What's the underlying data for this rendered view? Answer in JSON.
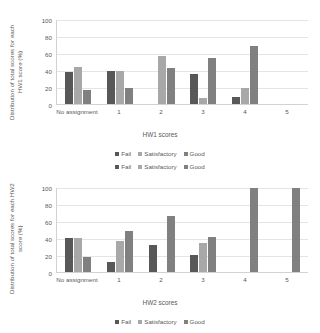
{
  "colors": {
    "fail": "#585858",
    "satisfactory": "#a8a8a8",
    "good": "#808080",
    "gridline": "#e4e4e4",
    "axis": "#d2d2d2",
    "text": "#595959"
  },
  "chart_data": [
    {
      "type": "bar",
      "title": "",
      "xlabel": "HW1 scores",
      "ylabel": "Distribution of total scores for each HW1 score (%)",
      "categories": [
        "No assignment",
        "1",
        "2",
        "3",
        "4",
        "5"
      ],
      "ylim": [
        0,
        100
      ],
      "yticks": [
        0,
        20,
        40,
        60,
        80,
        100
      ],
      "grid": true,
      "legend_position": "bottom",
      "series": [
        {
          "name": "Fail",
          "values": [
            38,
            39,
            0,
            35,
            8,
            0
          ]
        },
        {
          "name": "Satisfactory",
          "values": [
            44,
            39,
            57,
            7,
            19,
            0
          ]
        },
        {
          "name": "Good",
          "values": [
            16,
            19,
            42,
            54,
            68,
            0
          ]
        }
      ]
    },
    {
      "type": "bar",
      "title": "",
      "xlabel": "HW2 scores",
      "ylabel": "Distribution of total scores for each HW2 score (%)",
      "categories": [
        "No assignment",
        "1",
        "2",
        "3",
        "4",
        "5"
      ],
      "ylim": [
        0,
        100
      ],
      "yticks": [
        0,
        20,
        40,
        60,
        80,
        100
      ],
      "grid": true,
      "legend_position": "both",
      "series": [
        {
          "name": "Fail",
          "values": [
            40,
            12,
            32,
            20,
            0,
            0
          ]
        },
        {
          "name": "Satisfactory",
          "values": [
            40,
            36,
            0,
            34,
            0,
            0
          ]
        },
        {
          "name": "Good",
          "values": [
            18,
            48,
            66,
            41,
            99,
            99
          ]
        }
      ]
    }
  ],
  "legend": {
    "items": [
      {
        "label": "Fail",
        "key": "fail"
      },
      {
        "label": "Satisfactory",
        "key": "sat"
      },
      {
        "label": "Good",
        "key": "good"
      }
    ]
  }
}
